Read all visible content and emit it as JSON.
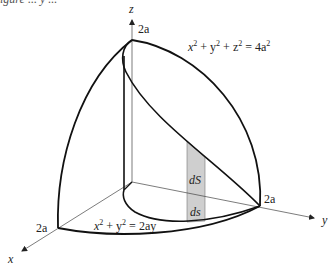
{
  "caption_fragment": "igure   ...   y ...",
  "axes": {
    "x_label": "x",
    "y_label": "y",
    "z_label": "z"
  },
  "intercepts": {
    "x": "2a",
    "y": "2a",
    "z": "2a"
  },
  "equations": {
    "sphere": {
      "lhs": "x",
      "exp1": "2",
      "p1": " + y",
      "exp2": "2",
      "p2": " + z",
      "exp3": "2",
      "rhs": " = 4a",
      "exp4": "2"
    },
    "cylinder": {
      "lhs": "x",
      "exp1": "2",
      "p1": " + y",
      "exp2": "2",
      "rhs": " = 2ay"
    }
  },
  "strip_labels": {
    "surface_element": "dS",
    "base_element": "ds"
  },
  "colors": {
    "stroke": "#111111",
    "axis": "#333333",
    "strip_fill": "#cfcfcf"
  }
}
